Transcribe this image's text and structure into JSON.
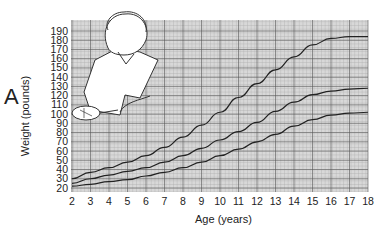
{
  "panel_label": "A",
  "chart_data": {
    "type": "line",
    "title": "",
    "xlabel": "Age (years)",
    "ylabel": "Weight (pounds)",
    "x": [
      2,
      3,
      4,
      5,
      6,
      7,
      8,
      9,
      10,
      11,
      12,
      13,
      14,
      15,
      16,
      17,
      18
    ],
    "xlim": [
      2,
      18
    ],
    "ylim": [
      20,
      190
    ],
    "xticks": [
      2,
      3,
      4,
      5,
      6,
      7,
      8,
      9,
      10,
      11,
      12,
      13,
      14,
      15,
      16,
      17,
      18
    ],
    "yticks": [
      20,
      30,
      40,
      50,
      60,
      70,
      80,
      90,
      100,
      110,
      120,
      130,
      140,
      150,
      160,
      170,
      180,
      190
    ],
    "grid": true,
    "legend": null,
    "series": [
      {
        "name": "upper",
        "values": [
          30,
          37,
          42,
          48,
          55,
          64,
          75,
          88,
          102,
          118,
          133,
          148,
          162,
          175,
          182,
          184,
          184
        ]
      },
      {
        "name": "middle",
        "values": [
          25,
          30,
          34,
          38,
          42,
          48,
          55,
          63,
          72,
          81,
          91,
          103,
          113,
          121,
          125,
          127,
          128
        ]
      },
      {
        "name": "lower",
        "values": [
          22,
          24,
          27,
          29,
          33,
          37,
          42,
          48,
          55,
          62,
          70,
          78,
          87,
          94,
          99,
          101,
          102
        ]
      }
    ],
    "annotations": [
      "Illustration of a teenage boy holding a tennis racket overlaid on upper-left of plot"
    ]
  }
}
